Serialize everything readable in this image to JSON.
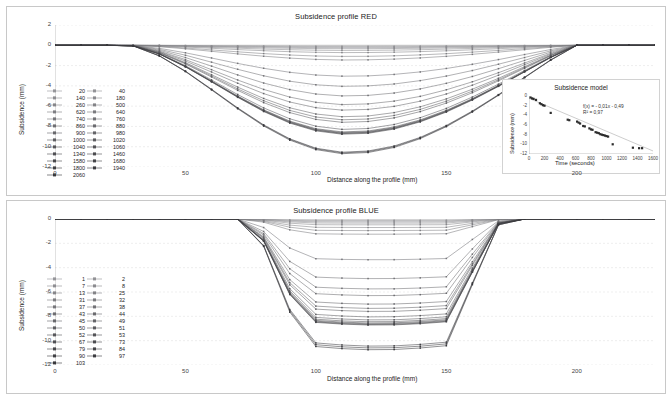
{
  "chart_data": [
    {
      "type": "line",
      "id": "subsidence-red",
      "title": "Subsidence profile RED",
      "xlabel": "Distance along the profile  (mm)",
      "ylabel": "Subsidence  (mm)",
      "xlim": [
        0,
        230
      ],
      "ylim": [
        -12,
        2
      ],
      "xticks": [
        0,
        50,
        100,
        150,
        200
      ],
      "yticks": [
        2,
        0,
        -2,
        -4,
        -6,
        -8,
        -10,
        -12
      ],
      "grid": true,
      "legend_position": "left-inside",
      "legend_columns": [
        [
          "20",
          "140",
          "260",
          "620",
          "740",
          "860",
          "900",
          "1000",
          "1040",
          "1340",
          "1580",
          "1800",
          "2060"
        ],
        [
          "40",
          "180",
          "500",
          "640",
          "760",
          "880",
          "980",
          "1020",
          "1060",
          "1460",
          "1680",
          "1940"
        ]
      ],
      "x": [
        0,
        10,
        20,
        30,
        40,
        50,
        60,
        70,
        80,
        90,
        100,
        110,
        120,
        130,
        140,
        150,
        160,
        170,
        180,
        190,
        200,
        210,
        220,
        230
      ],
      "series": [
        {
          "name": "20",
          "depth": -0.1
        },
        {
          "name": "40",
          "depth": -0.16
        },
        {
          "name": "140",
          "depth": -0.24
        },
        {
          "name": "180",
          "depth": -0.34
        },
        {
          "name": "260",
          "depth": -0.5
        },
        {
          "name": "500",
          "depth": -0.72
        },
        {
          "name": "620",
          "depth": -1.1
        },
        {
          "name": "640",
          "depth": -1.45
        },
        {
          "name": "740",
          "depth": -3.05
        },
        {
          "name": "760",
          "depth": -4.05
        },
        {
          "name": "860",
          "depth": -5.0
        },
        {
          "name": "880",
          "depth": -5.85
        },
        {
          "name": "900",
          "depth": -6.4
        },
        {
          "name": "980",
          "depth": -7.05
        },
        {
          "name": "1000",
          "depth": -7.35
        },
        {
          "name": "1020",
          "depth": -7.6
        },
        {
          "name": "1040",
          "depth": -8.3
        },
        {
          "name": "1060",
          "depth": -8.55
        },
        {
          "name": "1340",
          "depth": -8.62
        },
        {
          "name": "1460",
          "depth": -8.68
        },
        {
          "name": "1580",
          "depth": -8.72
        },
        {
          "name": "1680",
          "depth": -8.78
        },
        {
          "name": "1800",
          "depth": -10.55
        },
        {
          "name": "1940",
          "depth": -10.62
        },
        {
          "name": "2060",
          "depth": -10.7
        }
      ]
    },
    {
      "type": "line",
      "id": "subsidence-blue",
      "title": "Subsidence profile BLUE",
      "xlabel": "Distance along the profile  (mm)",
      "ylabel": "Subsidence  (mm)",
      "xlim": [
        0,
        230
      ],
      "ylim": [
        -12,
        0
      ],
      "xticks": [
        0,
        50,
        100,
        150,
        200
      ],
      "yticks": [
        0,
        -2,
        -4,
        -6,
        -8,
        -10,
        -12
      ],
      "grid": true,
      "legend_position": "left-inside",
      "legend_columns": [
        [
          "1",
          "7",
          "13",
          "31",
          "37",
          "43",
          "45",
          "50",
          "52",
          "67",
          "79",
          "90",
          "103"
        ],
        [
          "2",
          "8",
          "25",
          "32",
          "38",
          "44",
          "49",
          "51",
          "53",
          "73",
          "84",
          "97"
        ]
      ],
      "x": [
        0,
        10,
        20,
        30,
        40,
        50,
        60,
        70,
        80,
        90,
        100,
        110,
        120,
        130,
        140,
        150,
        160,
        170,
        180,
        190,
        200,
        210,
        220,
        230
      ],
      "series": [
        {
          "name": "1",
          "depth": -0.1
        },
        {
          "name": "2",
          "depth": -0.16
        },
        {
          "name": "7",
          "depth": -0.24
        },
        {
          "name": "8",
          "depth": -0.34
        },
        {
          "name": "13",
          "depth": -0.48
        },
        {
          "name": "25",
          "depth": -0.7
        },
        {
          "name": "31",
          "depth": -0.95
        },
        {
          "name": "32",
          "depth": -1.25
        },
        {
          "name": "37",
          "depth": -3.35
        },
        {
          "name": "38",
          "depth": -4.9
        },
        {
          "name": "43",
          "depth": -5.75
        },
        {
          "name": "44",
          "depth": -6.3
        },
        {
          "name": "45",
          "depth": -7.0
        },
        {
          "name": "49",
          "depth": -7.35
        },
        {
          "name": "50",
          "depth": -7.6
        },
        {
          "name": "51",
          "depth": -8.05
        },
        {
          "name": "52",
          "depth": -8.3
        },
        {
          "name": "53",
          "depth": -8.45
        },
        {
          "name": "67",
          "depth": -8.55
        },
        {
          "name": "73",
          "depth": -8.62
        },
        {
          "name": "79",
          "depth": -8.68
        },
        {
          "name": "84",
          "depth": -8.72
        },
        {
          "name": "90",
          "depth": -10.45
        },
        {
          "name": "97",
          "depth": -10.6
        },
        {
          "name": "103",
          "depth": -10.75
        }
      ]
    },
    {
      "type": "scatter",
      "id": "subsidence-model-inset",
      "title": "Subsidence model",
      "xlabel": "Time (seconds)",
      "ylabel": "Subsidence  (mm)",
      "xlim": [
        0,
        1600
      ],
      "ylim": [
        -12,
        0
      ],
      "xticks": [
        0,
        200,
        400,
        600,
        800,
        1000,
        1200,
        1400,
        1600
      ],
      "yticks": [
        0,
        -2,
        -4,
        -6,
        -8,
        -10,
        -12
      ],
      "grid": false,
      "equation": "f(x) = - 0,01x - 0,49",
      "r_squared": "R² = 0,97",
      "fit_line": {
        "slope": -0.0068,
        "intercept": -0.49
      },
      "points": [
        [
          20,
          -0.3
        ],
        [
          40,
          -0.5
        ],
        [
          60,
          -0.6
        ],
        [
          90,
          -0.8
        ],
        [
          140,
          -1.5
        ],
        [
          160,
          -1.7
        ],
        [
          180,
          -1.9
        ],
        [
          200,
          -2.0
        ],
        [
          280,
          -3.5
        ],
        [
          500,
          -4.9
        ],
        [
          520,
          -5.0
        ],
        [
          620,
          -5.3
        ],
        [
          640,
          -5.5
        ],
        [
          660,
          -5.7
        ],
        [
          700,
          -6.2
        ],
        [
          720,
          -6.3
        ],
        [
          780,
          -6.7
        ],
        [
          800,
          -6.9
        ],
        [
          820,
          -7.0
        ],
        [
          860,
          -7.5
        ],
        [
          880,
          -7.6
        ],
        [
          900,
          -7.7
        ],
        [
          920,
          -7.9
        ],
        [
          940,
          -8.0
        ],
        [
          960,
          -8.1
        ],
        [
          980,
          -8.2
        ],
        [
          1000,
          -8.3
        ],
        [
          1020,
          -8.4
        ],
        [
          1080,
          -10.0
        ],
        [
          1340,
          -10.7
        ],
        [
          1420,
          -10.8
        ],
        [
          1460,
          -10.8
        ]
      ]
    }
  ]
}
